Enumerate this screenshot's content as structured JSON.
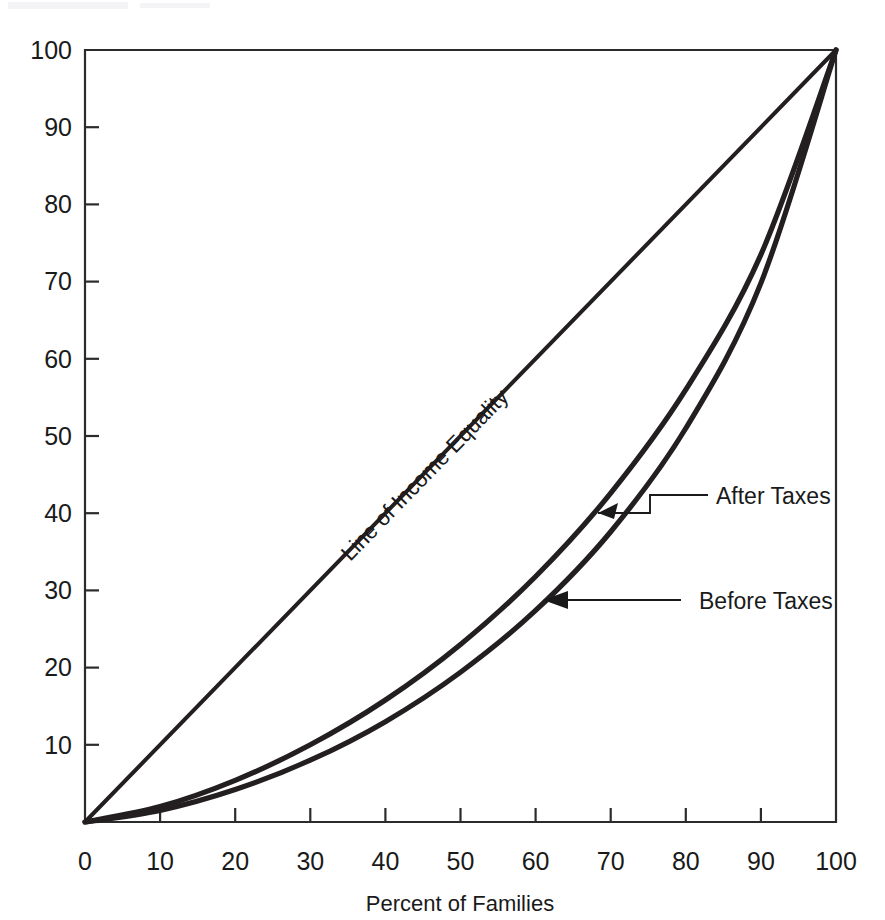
{
  "chart_data": {
    "type": "line",
    "title": "",
    "subtitle": "",
    "xlabel": "Percent of Families",
    "ylabel": "",
    "xlim": [
      0,
      100
    ],
    "ylim": [
      0,
      100
    ],
    "grid": false,
    "legend_position": "inline-annotations",
    "x_ticks": [
      "0",
      "10",
      "20",
      "30",
      "40",
      "50",
      "60",
      "70",
      "80",
      "90",
      "100"
    ],
    "x_tick_values": [
      0,
      10,
      20,
      30,
      40,
      50,
      60,
      70,
      80,
      90,
      100
    ],
    "y_ticks": [
      "10",
      "20",
      "30",
      "40",
      "50",
      "60",
      "70",
      "80",
      "90",
      "100"
    ],
    "y_tick_values": [
      10,
      20,
      30,
      40,
      50,
      60,
      70,
      80,
      90,
      100
    ],
    "x": [
      0,
      10,
      20,
      30,
      40,
      50,
      60,
      70,
      80,
      90,
      100
    ],
    "series": [
      {
        "name": "Line of Income Equality",
        "label": "Line of Income Equality",
        "values": [
          0,
          10,
          20,
          30,
          40,
          50,
          60,
          70,
          80,
          90,
          100
        ],
        "style": "straight-diagonal",
        "color": "#231f20"
      },
      {
        "name": "After Taxes",
        "label": "After Taxes",
        "values": [
          0,
          2.0,
          5.4,
          10.0,
          15.8,
          23.0,
          31.8,
          42.6,
          56.0,
          73.5,
          100
        ],
        "style": "lorenz-curve",
        "color": "#231f20"
      },
      {
        "name": "Before Taxes",
        "label": "Before Taxes",
        "values": [
          0,
          1.5,
          4.2,
          8.0,
          13.0,
          19.4,
          27.4,
          37.6,
          51.0,
          69.8,
          100
        ],
        "style": "lorenz-curve",
        "color": "#231f20"
      }
    ],
    "annotations": [
      {
        "name": "after-taxes-annotation",
        "text": "After Taxes",
        "target_x": 60.0,
        "target_y": 31.8,
        "arrow": "stepped-leader-left"
      },
      {
        "name": "before-taxes-annotation",
        "text": "Before Taxes",
        "target_x": 62.5,
        "target_y": 29.5,
        "arrow": "straight-arrow-left"
      },
      {
        "name": "equality-line-label",
        "text": "Line of Income Equality",
        "rotation": -45,
        "placement": "along-diagonal"
      }
    ],
    "colors": {
      "line": "#231f20",
      "axis": "#2b2b2b",
      "text": "#1a1a1a",
      "background": "#ffffff"
    }
  },
  "axes": {
    "x_axis_label": "Percent of Families",
    "y_axis_label": ""
  },
  "labels": {
    "equality": "Line of Income Equality",
    "after_taxes": "After Taxes",
    "before_taxes": "Before Taxes"
  },
  "x_tick_labels": {
    "t0": "0",
    "t1": "10",
    "t2": "20",
    "t3": "30",
    "t4": "40",
    "t5": "50",
    "t6": "60",
    "t7": "70",
    "t8": "80",
    "t9": "90",
    "t10": "100"
  },
  "y_tick_labels": {
    "t1": "10",
    "t2": "20",
    "t3": "30",
    "t4": "40",
    "t5": "50",
    "t6": "60",
    "t7": "70",
    "t8": "80",
    "t9": "90",
    "t10": "100"
  }
}
